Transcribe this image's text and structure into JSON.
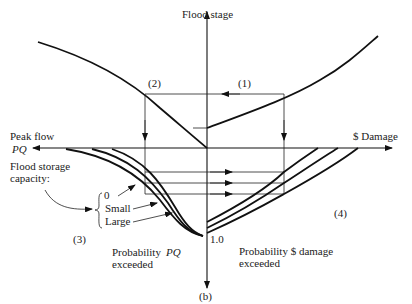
{
  "diagram": {
    "axes": {
      "vertical_top_label": "Flood stage",
      "horizontal_left_label_line1": "Peak flow",
      "horizontal_left_label_line2": "PQ",
      "horizontal_right_label": "$ Damage",
      "bottom_label": "(b)",
      "origin_bottom_value": "1.0"
    },
    "quadrant_labels": {
      "q1": "(1)",
      "q2": "(2)",
      "q3": "(3)",
      "q4": "(4)"
    },
    "storage": {
      "title_line1": "Flood storage",
      "title_line2": "capacity:",
      "options": [
        "0",
        "Small",
        "Large"
      ]
    },
    "probability_labels": {
      "left_line1": "Probability",
      "left_line1_var": "PQ",
      "left_line2": "exceeded",
      "right_line1": "Probability $ damage",
      "right_line2": "exceeded"
    }
  }
}
